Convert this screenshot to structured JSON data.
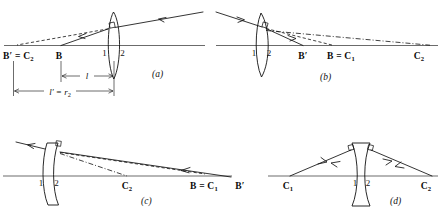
{
  "figure": {
    "background_color": "#ffffff",
    "ink_color": "#111111",
    "panels": [
      {
        "id": "a",
        "letter": "(a)",
        "lens_type": "biconvex",
        "surface_labels": [
          "1",
          "2"
        ],
        "axis_labels": [
          {
            "text": "B′ = C",
            "sub": "2"
          },
          {
            "text": "B",
            "sub": ""
          }
        ],
        "dimensions": [
          {
            "text": "l",
            "sub": ""
          },
          {
            "text": "l′ = r",
            "sub": "2"
          }
        ]
      },
      {
        "id": "b",
        "letter": "(b)",
        "lens_type": "meniscus-right",
        "surface_labels": [
          "1",
          "2"
        ],
        "axis_labels": [
          {
            "text": "B′",
            "sub": ""
          },
          {
            "text": "B = C",
            "sub": "1"
          },
          {
            "text": "C",
            "sub": "2"
          }
        ],
        "dimensions": []
      },
      {
        "id": "c",
        "letter": "(c)",
        "lens_type": "meniscus-left",
        "surface_labels": [
          "1",
          "2"
        ],
        "axis_labels": [
          {
            "text": "C",
            "sub": "2"
          },
          {
            "text": "B = C",
            "sub": "1"
          },
          {
            "text": "B′",
            "sub": ""
          }
        ],
        "dimensions": []
      },
      {
        "id": "d",
        "letter": "(d)",
        "lens_type": "biconcave",
        "surface_labels": [
          "1",
          "2"
        ],
        "axis_labels": [
          {
            "text": "C",
            "sub": "1"
          },
          {
            "text": "C",
            "sub": "2"
          }
        ],
        "dimensions": []
      }
    ]
  }
}
